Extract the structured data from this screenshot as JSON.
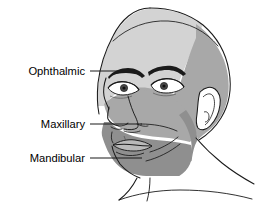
{
  "illustration": {
    "subject": "Trigeminal nerve sensory distribution on the human head",
    "view": "three-quarter left-facing profile",
    "background_color": "#ffffff",
    "outline_color": "#1a1a1a"
  },
  "labels": [
    {
      "id": "ophthalmic",
      "text": "Ophthalmic",
      "text_x": 85,
      "text_y": 75,
      "leader_x1": 90,
      "leader_y1": 71,
      "leader_x2": 137,
      "leader_y2": 71,
      "region_color": "#d3d3d3"
    },
    {
      "id": "maxillary",
      "text": "Maxillary",
      "text_x": 85,
      "text_y": 128,
      "leader_x1": 90,
      "leader_y1": 124,
      "leader_x2": 142,
      "leader_y2": 124,
      "region_color": "#a8a8a8"
    },
    {
      "id": "mandibular",
      "text": "Mandibular",
      "text_x": 85,
      "text_y": 162,
      "leader_x1": 90,
      "leader_y1": 158,
      "leader_x2": 142,
      "leader_y2": 158,
      "region_color": "#8f8f8f"
    }
  ],
  "regions": {
    "ophthalmic_label": "Ophthalmic division (V1)",
    "maxillary_label": "Maxillary division (V2)",
    "mandibular_label": "Mandibular division (V3)"
  },
  "colors": {
    "ophthalmic": "#d3d3d3",
    "maxillary": "#a8a8a8",
    "mandibular": "#8f8f8f",
    "skin_unshaded": "#ffffff",
    "line": "#1a1a1a",
    "brow": "#1a1a1a",
    "text": "#000000"
  }
}
